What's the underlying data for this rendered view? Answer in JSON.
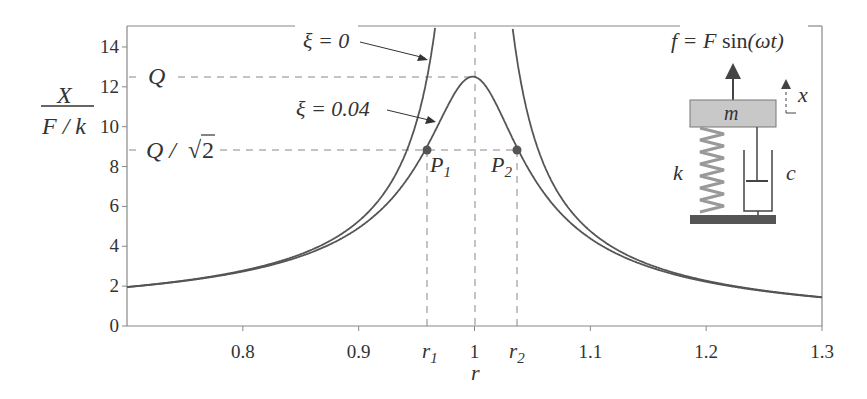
{
  "chart_data": {
    "type": "line",
    "title": "",
    "xlabel": "r",
    "ylabel_numerator": "X",
    "ylabel_denominator": "F / k",
    "xlim": [
      0.7,
      1.3
    ],
    "ylim": [
      0,
      15
    ],
    "grid": false,
    "x_ticks": [
      "0.8",
      "0.9",
      "1",
      "1.1",
      "1.2",
      "1.3"
    ],
    "x_special_ticks": [
      {
        "label": "r",
        "sub": "1",
        "x": 0.96
      },
      {
        "label": "r",
        "sub": "2",
        "x": 1.04
      }
    ],
    "y_ticks": [
      "0",
      "2",
      "4",
      "6",
      "8",
      "10",
      "12",
      "14"
    ],
    "series": [
      {
        "name": "ξ = 0",
        "damping": 0,
        "formula": "1/|1-r^2|"
      },
      {
        "name": "ξ = 0.04",
        "damping": 0.04,
        "formula": "1/sqrt((1-r^2)^2+(2ξr)^2)"
      }
    ],
    "annotations": {
      "Q": {
        "label": "Q",
        "y": 12.5
      },
      "Q_over_sqrt2": {
        "label": "Q / √2",
        "y": 8.84
      },
      "P1": {
        "label": "P",
        "sub": "1",
        "x": 0.96,
        "y": 8.84
      },
      "P2": {
        "label": "P",
        "sub": "2",
        "x": 1.04,
        "y": 8.84
      },
      "curve_label_0": "ξ = 0",
      "curve_label_1": "ξ = 0.04"
    },
    "inset": {
      "force": "f = F sin(ωt)",
      "mass": "m",
      "spring": "k",
      "damper": "c",
      "displacement": "x"
    }
  }
}
